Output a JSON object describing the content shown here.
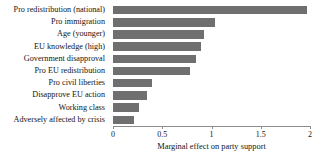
{
  "chart_data": {
    "type": "bar",
    "orientation": "horizontal",
    "title": "",
    "xlabel": "Marginal effect on party support",
    "ylabel": "",
    "xlim": [
      0,
      2
    ],
    "xticks": [
      "0",
      "0.5",
      "1",
      "1.5",
      "2"
    ],
    "xtick_values": [
      0,
      0.5,
      1,
      1.5,
      2
    ],
    "grid": false,
    "legend": null,
    "bar_color": "#6f6f6f",
    "categories": [
      "Pro redistribution (national)",
      "Pro immigration",
      "Age (younger)",
      "EU knowledge (high)",
      "Government disapproval",
      "Pro EU redistribution",
      "Pro civil liberties",
      "Disapprove EU action",
      "Working class",
      "Adversely affected by crisis"
    ],
    "values": [
      1.97,
      1.04,
      0.92,
      0.89,
      0.84,
      0.78,
      0.4,
      0.35,
      0.26,
      0.21
    ]
  }
}
